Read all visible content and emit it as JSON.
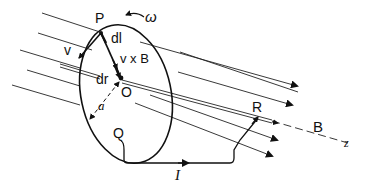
{
  "diagram": {
    "labels": {
      "point_p": "P",
      "omega": "ω",
      "dl": "dl",
      "velocity": "v",
      "v_cross_b": "v x B",
      "dr": "dr",
      "center_o": "O",
      "radius": "a",
      "point_r": "R",
      "point_q": "Q",
      "field_b": "B",
      "axis_z": "z",
      "current": "I"
    },
    "colors": {
      "ink": "#111111",
      "background": "#ffffff"
    }
  }
}
